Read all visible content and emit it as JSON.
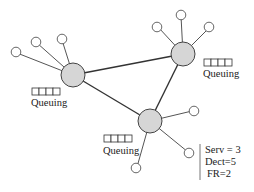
{
  "diagram": {
    "type": "network-topology",
    "hubs": [
      {
        "id": "hub-left",
        "label": "Queuing",
        "queue_slots": 4
      },
      {
        "id": "hub-top-right",
        "label": "Queuing",
        "queue_slots": 4
      },
      {
        "id": "hub-bottom",
        "label": "Queuing",
        "queue_slots": 4
      }
    ],
    "edges": [
      [
        "hub-left",
        "hub-top-right"
      ],
      [
        "hub-left",
        "hub-bottom"
      ],
      [
        "hub-top-right",
        "hub-bottom"
      ]
    ],
    "leaf_counts": {
      "hub-left": 3,
      "hub-top-right": 3,
      "hub-bottom": 3
    },
    "queue_label": "Queuing",
    "stats": {
      "serv": "Serv = 3",
      "dect": "Dect=5",
      "fr": "FR=2"
    }
  }
}
